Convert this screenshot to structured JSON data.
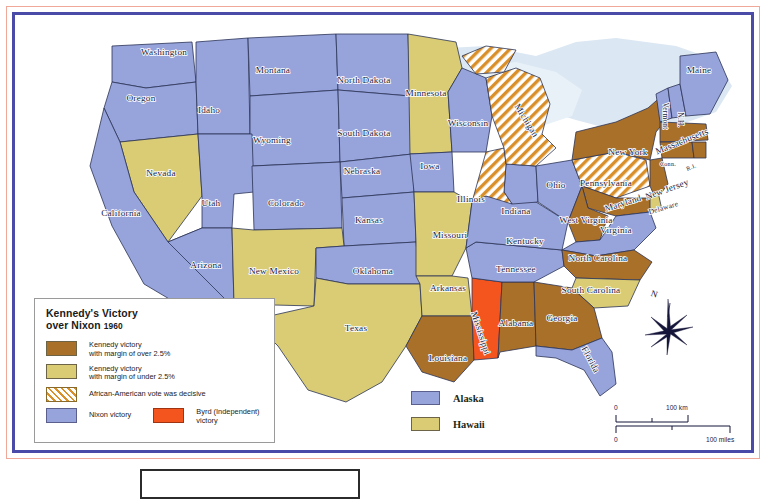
{
  "map": {
    "title_line1": "Kennedy's Victory",
    "title_line2": "over Nixon",
    "title_year": "1960"
  },
  "legend": {
    "items": [
      {
        "swatch": "brown",
        "line1": "Kennedy victory",
        "line2": "with margin of over 2.5%"
      },
      {
        "swatch": "khaki",
        "line1": "Kennedy victory",
        "line2": "with margin of under 2.5%"
      },
      {
        "swatch": "hatch",
        "line1": "African-American vote was decisive",
        "line2": ""
      },
      {
        "swatch": "blue",
        "line1": "Nixon victory",
        "line2": ""
      },
      {
        "swatch": "orange",
        "line1": "Byrd (Independent)",
        "line2": "victory"
      }
    ]
  },
  "inset_key": {
    "items": [
      {
        "swatch": "blue",
        "label": "Alaska"
      },
      {
        "swatch": "khaki",
        "label": "Hawaii"
      }
    ]
  },
  "compass": {
    "north_label": "N"
  },
  "scale": {
    "km_zero": "0",
    "km_max": "100 km",
    "mi_zero": "0",
    "mi_max": "100 miles"
  },
  "colors": {
    "kennedy_over": "#a9702a",
    "kennedy_under": "#d9cc74",
    "nixon": "#97a3db",
    "byrd": "#f4551f",
    "hatch_stroke": "#d9902a",
    "water": "#dbe7f2",
    "border_red": "#f0a898",
    "border_blue": "#4a4aa8"
  },
  "states": [
    {
      "name": "Washington",
      "x": 148,
      "y": 39,
      "cat": "nixon"
    },
    {
      "name": "Oregon",
      "x": 125,
      "y": 85,
      "cat": "nixon"
    },
    {
      "name": "Idaho",
      "x": 193,
      "y": 97,
      "cat": "nixon"
    },
    {
      "name": "Montana",
      "x": 257,
      "y": 57,
      "cat": "nixon"
    },
    {
      "name": "Wyoming",
      "x": 256,
      "y": 127,
      "cat": "nixon"
    },
    {
      "name": "North Dakota",
      "x": 348,
      "y": 67,
      "cat": "nixon"
    },
    {
      "name": "South Dakota",
      "x": 348,
      "y": 120,
      "cat": "nixon"
    },
    {
      "name": "Nebraska",
      "x": 346,
      "y": 158,
      "cat": "nixon"
    },
    {
      "name": "Minnesota",
      "x": 410,
      "y": 80,
      "cat": "kennedy_under"
    },
    {
      "name": "Wisconsin",
      "x": 452,
      "y": 110,
      "cat": "nixon"
    },
    {
      "name": "Michigan",
      "x": 508,
      "y": 106,
      "cat": "hatch"
    },
    {
      "name": "Iowa",
      "x": 414,
      "y": 153,
      "cat": "nixon"
    },
    {
      "name": "Illinois",
      "x": 455,
      "y": 186,
      "cat": "hatch"
    },
    {
      "name": "Indiana",
      "x": 500,
      "y": 198,
      "cat": "nixon"
    },
    {
      "name": "Ohio",
      "x": 540,
      "y": 172,
      "cat": "nixon"
    },
    {
      "name": "Nevada",
      "x": 145,
      "y": 160,
      "cat": "kennedy_under"
    },
    {
      "name": "Utah",
      "x": 195,
      "y": 190,
      "cat": "nixon"
    },
    {
      "name": "Colorado",
      "x": 270,
      "y": 190,
      "cat": "nixon"
    },
    {
      "name": "Kansas",
      "x": 353,
      "y": 207,
      "cat": "nixon"
    },
    {
      "name": "Missouri",
      "x": 434,
      "y": 222,
      "cat": "kennedy_under"
    },
    {
      "name": "Kentucky",
      "x": 509,
      "y": 228,
      "cat": "nixon"
    },
    {
      "name": "West Virginia",
      "x": 570,
      "y": 207,
      "cat": "kennedy_over"
    },
    {
      "name": "Virginia",
      "x": 600,
      "y": 217,
      "cat": "nixon"
    },
    {
      "name": "California",
      "x": 105,
      "y": 200,
      "cat": "nixon"
    },
    {
      "name": "Arizona",
      "x": 190,
      "y": 252,
      "cat": "nixon"
    },
    {
      "name": "New Mexico",
      "x": 258,
      "y": 258,
      "cat": "kennedy_under"
    },
    {
      "name": "Oklahoma",
      "x": 357,
      "y": 258,
      "cat": "nixon"
    },
    {
      "name": "Arkansas",
      "x": 432,
      "y": 275,
      "cat": "kennedy_under"
    },
    {
      "name": "Tennessee",
      "x": 500,
      "y": 256,
      "cat": "nixon"
    },
    {
      "name": "North Carolina",
      "x": 582,
      "y": 245,
      "cat": "kennedy_over"
    },
    {
      "name": "South Carolina",
      "x": 575,
      "y": 277,
      "cat": "kennedy_under"
    },
    {
      "name": "Texas",
      "x": 340,
      "y": 315,
      "cat": "kennedy_under"
    },
    {
      "name": "Louisiana",
      "x": 432,
      "y": 345,
      "cat": "kennedy_over"
    },
    {
      "name": "Mississippi",
      "x": 462,
      "y": 318,
      "cat": "byrd"
    },
    {
      "name": "Alabama",
      "x": 500,
      "y": 310,
      "cat": "kennedy_over"
    },
    {
      "name": "Georgia",
      "x": 546,
      "y": 305,
      "cat": "kennedy_over"
    },
    {
      "name": "Florida",
      "x": 572,
      "y": 345,
      "cat": "nixon"
    },
    {
      "name": "Maine",
      "x": 683,
      "y": 57,
      "cat": "nixon"
    },
    {
      "name": "Vermont",
      "x": 647,
      "y": 100,
      "cat": "nixon"
    },
    {
      "name": "N.H.",
      "x": 662,
      "y": 104,
      "cat": "nixon"
    },
    {
      "name": "New York",
      "x": 612,
      "y": 139,
      "cat": "kennedy_over"
    },
    {
      "name": "Massachusetts",
      "x": 667,
      "y": 128,
      "cat": "kennedy_over"
    },
    {
      "name": "Conn.",
      "x": 652,
      "y": 150,
      "cat": "kennedy_over"
    },
    {
      "name": "R.I.",
      "x": 676,
      "y": 153,
      "cat": "kennedy_over"
    },
    {
      "name": "Pennsylvania",
      "x": 590,
      "y": 170,
      "cat": "hatch"
    },
    {
      "name": "New Jersey",
      "x": 652,
      "y": 176,
      "cat": "kennedy_over"
    },
    {
      "name": "Maryland",
      "x": 608,
      "y": 190,
      "cat": "kennedy_over"
    },
    {
      "name": "Delaware",
      "x": 648,
      "y": 194,
      "cat": "kennedy_under"
    }
  ]
}
